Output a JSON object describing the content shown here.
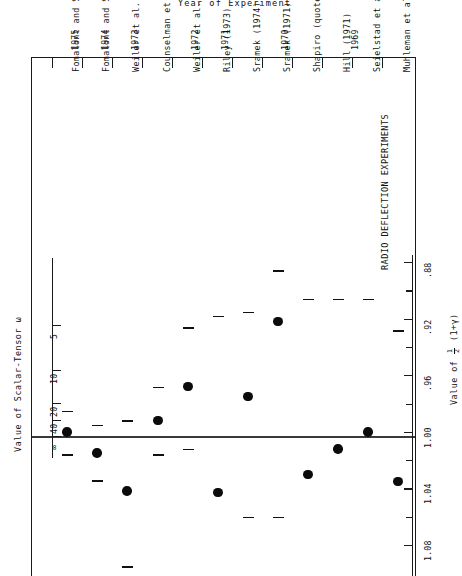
{
  "title": "Year of Experiment",
  "panel_label": "RADIO DEFLECTION EXPERIMENTS",
  "value_axis": {
    "label": "Value of ½(1+γ)",
    "label_parts": {
      "prefix": "Value of",
      "num": "1",
      "den": "2",
      "rest": "(1+γ)"
    },
    "ticks": [
      ".88",
      ".92",
      ".96",
      "1.00",
      "1.04",
      "1.08"
    ],
    "minor_ticks": 11
  },
  "omega_axis": {
    "label": "Value of Scalar-Tensor ω",
    "ticks": [
      "5",
      "10",
      "20",
      "40",
      "∞"
    ]
  },
  "year_axis": {
    "label": "Year of Experiment",
    "years": [
      "1975",
      "1974",
      "1973",
      "1972",
      "1971",
      "1970",
      "1969"
    ]
  },
  "chart_data": {
    "type": "scatter",
    "title": "Year of Experiment",
    "xlabel": "Year of Experiment",
    "ylabel": "Value of ½(1+γ)",
    "ylabel_secondary": "Value of Scalar-Tensor ω",
    "orientation": "rotated-90",
    "ylim": [
      0.86,
      1.1
    ],
    "reference_line": 1.0,
    "grid": false,
    "legend": null,
    "categories": [
      "Fomalont and Sramek (1976)",
      "Fomalont and Sramek (1975)",
      "Weiler et al. (1975)",
      "Counselman et al. (1974)",
      "Weiler et al. (1974)",
      "Riley (1973)",
      "Sramek (1974)",
      "Sramek (1971)",
      "Shapiro (quoted in Weinberg 1972)",
      "Hill (1971)",
      "Seielstad et al. (1970)",
      "Muhleman et al. (1970)"
    ],
    "points": [
      {
        "label": "Fomalont and Sramek (1976)",
        "year": "1975",
        "value": 1.0,
        "err_low": 0.985,
        "err_high": 1.016
      },
      {
        "label": "Fomalont and Sramek (1975)",
        "year": "1974",
        "value": 1.015,
        "err_low": 0.995,
        "err_high": 1.034
      },
      {
        "label": "Weiler et al. (1975)",
        "year": "1973",
        "value": 1.042,
        "err_low": 0.992,
        "err_high": 1.095
      },
      {
        "label": "Counselman et al. (1974)",
        "year": "1972",
        "value": 0.992,
        "err_low": 0.968,
        "err_high": 1.016
      },
      {
        "label": "Weiler et al. (1974)",
        "year": "1972",
        "value": 0.968,
        "err_low": 0.926,
        "err_high": 1.012
      },
      {
        "label": "Riley (1973)",
        "year": "1971",
        "value": 1.043,
        "err_low": 0.918,
        "err_high": 1.1
      },
      {
        "label": "Sramek (1974)",
        "year": "1971",
        "value": 0.975,
        "err_low": 0.915,
        "err_high": 1.06
      },
      {
        "label": "Sramek (1971)",
        "year": "1970",
        "value": 0.922,
        "err_low": 0.886,
        "err_high": 1.06
      },
      {
        "label": "Shapiro (quoted in Weinberg 1972)",
        "year": "1970",
        "value": 1.03,
        "err_low": 0.906,
        "err_high": 1.1
      },
      {
        "label": "Hill (1971)",
        "year": "1970",
        "value": 1.012,
        "err_low": 0.906,
        "err_high": 1.1
      },
      {
        "label": "Seielstad et al. (1970)",
        "year": "1969",
        "value": 1.0,
        "err_low": 0.906,
        "err_high": 1.1
      },
      {
        "label": "Muhleman et al. (1970)",
        "year": "1969",
        "value": 1.035,
        "err_low": 0.928,
        "err_high": 1.1
      }
    ]
  }
}
